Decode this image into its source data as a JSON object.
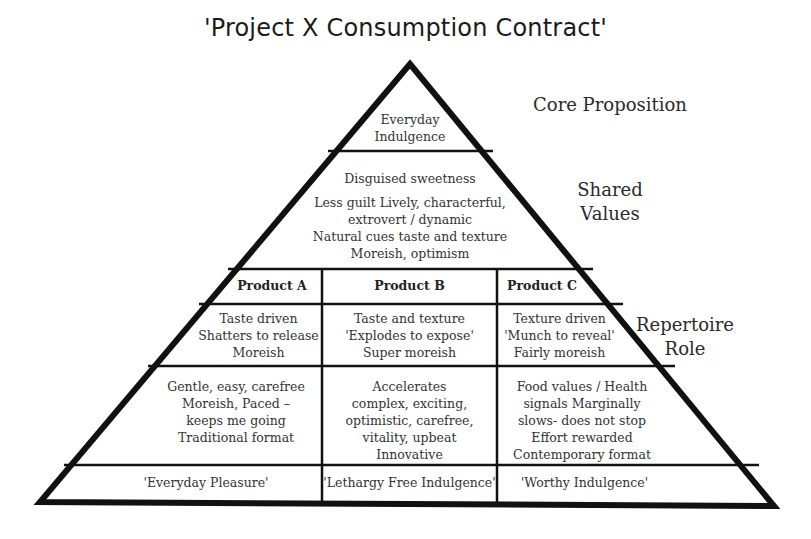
{
  "title": "'Project X Consumption Contract'",
  "side_labels": {
    "core": "Core Proposition",
    "shared": "Shared\nValues",
    "repertoire": "Repertoire\nRole"
  },
  "pyramid": {
    "apex": "Everyday\nIndulgence",
    "shared_values": {
      "heading": "Disguised sweetness",
      "body": "Less guilt Lively, characterful,\nextrovert / dynamic\nNatural cues taste and texture\nMoreish, optimism"
    },
    "products": [
      {
        "name": "Product A",
        "role": "Taste driven\nShatters to release\nMoreish",
        "values": "Gentle, easy, carefree\nMoreish, Paced –\nkeeps me going\nTraditional format",
        "tagline": "'Everyday Pleasure'"
      },
      {
        "name": "Product B",
        "role": "Taste and texture\n'Explodes to expose'\nSuper moreish",
        "values": "Accelerates\ncomplex, exciting,\noptimistic, carefree,\nvitality, upbeat\nInnovative",
        "tagline": "'Lethargy Free Indulgence'"
      },
      {
        "name": "Product C",
        "role": "Texture driven\n'Munch to reveal'\nFairly moreish",
        "values": "Food values / Health\nsignals Marginally\nslows- does not stop\nEffort rewarded\nContemporary format",
        "tagline": "'Worthy Indulgence'"
      }
    ]
  }
}
